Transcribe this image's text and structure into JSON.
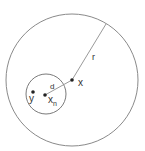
{
  "diagram": {
    "outer_circle": {
      "cx": 72,
      "cy": 80,
      "r": 66,
      "stroke": "#888888"
    },
    "inner_circle": {
      "cx": 46,
      "cy": 94,
      "r": 20,
      "stroke": "#777777"
    },
    "radius_line": {
      "x1": 72,
      "y1": 80,
      "x2": 106,
      "y2": 24
    },
    "distance_line": {
      "x1": 72,
      "y1": 80,
      "x2": 45,
      "y2": 95
    },
    "points": {
      "x": {
        "cx": 72,
        "cy": 80
      },
      "x_n": {
        "cx": 45,
        "cy": 95
      },
      "y": {
        "cx": 33,
        "cy": 92
      }
    },
    "labels": {
      "r": "r",
      "d": "d",
      "x": "x",
      "x_n_base": "x",
      "x_n_sub": "n",
      "y": "y"
    },
    "colors": {
      "line": "#999999",
      "point": "#222222",
      "text": "#333333"
    }
  }
}
